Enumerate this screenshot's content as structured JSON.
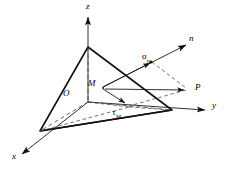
{
  "figure": {
    "background_color": "#ffffff",
    "line_color": "#1a1a1a",
    "dashed_color": "#444444"
  },
  "axes": [
    {
      "id": "z",
      "label": "z",
      "label_x": 86,
      "label_y": 2,
      "direction": "up"
    },
    {
      "id": "y",
      "label": "y",
      "label_x": 212,
      "label_y": 107,
      "direction": "right"
    },
    {
      "id": "x",
      "label": "x",
      "label_x": 12,
      "label_y": 158,
      "direction": "lower-left"
    },
    {
      "id": "n",
      "label": "n",
      "label_x": 189,
      "label_y": 38,
      "direction": "upper-right"
    }
  ],
  "points": [
    {
      "id": "O",
      "label": "O",
      "label_x": 63,
      "label_y": 91
    },
    {
      "id": "M",
      "label": "M",
      "label_x": 89,
      "label_y": 80
    },
    {
      "id": "P",
      "label": "P",
      "label_x": 195,
      "label_y": 86
    }
  ],
  "vectors": [
    {
      "id": "sigma-n",
      "symbol": "σ",
      "subscript": "n",
      "label_x": 143,
      "label_y": 56,
      "description": "normal stress component along n"
    },
    {
      "id": "tau-M",
      "symbol": "τ",
      "subscript": "M",
      "label_x": 113,
      "label_y": 113,
      "description": "shear stress component in the plane"
    }
  ],
  "geometry": {
    "origin": [
      75,
      102
    ],
    "apex_z": [
      88,
      47
    ],
    "vertex_x": [
      40,
      131
    ],
    "vertex_y": [
      172,
      110
    ],
    "point_M": [
      103,
      87
    ],
    "point_P": [
      187,
      90
    ],
    "sigma_tip": [
      152,
      62
    ],
    "tau_tip": [
      127,
      104
    ]
  }
}
